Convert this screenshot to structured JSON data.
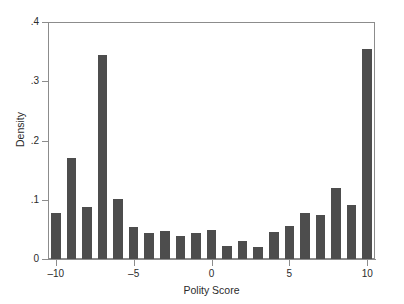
{
  "chart_data": {
    "type": "bar",
    "title": "",
    "subtitle": "",
    "xlabel": "Polity Score",
    "ylabel": "Density",
    "categories": [
      -10,
      -9,
      -8,
      -7,
      -6,
      -5,
      -4,
      -3,
      -2,
      -1,
      0,
      1,
      2,
      3,
      4,
      5,
      6,
      7,
      8,
      9,
      10
    ],
    "values": [
      0.077,
      0.17,
      0.088,
      0.345,
      0.101,
      0.054,
      0.044,
      0.048,
      0.039,
      0.044,
      0.049,
      0.022,
      0.031,
      0.021,
      0.045,
      0.055,
      0.078,
      0.075,
      0.12,
      0.092,
      0.355
    ],
    "xlim": [
      -10.5,
      10.5
    ],
    "ylim": [
      0,
      0.4
    ],
    "xticks": [
      -10,
      -5,
      0,
      5,
      10
    ],
    "xtick_labels": [
      "–10",
      "–5",
      "0",
      "5",
      "10"
    ],
    "yticks": [
      0,
      0.1,
      0.2,
      0.3,
      0.4
    ],
    "ytick_labels": [
      "0",
      ".1",
      ".2",
      ".3",
      ".4"
    ],
    "grid": false,
    "legend": null,
    "bar_color": "#4d4d4d",
    "axis_color": "#8c8c8c",
    "background_color": "#ffffff",
    "bar_width_fraction": 0.62,
    "annotations": []
  }
}
